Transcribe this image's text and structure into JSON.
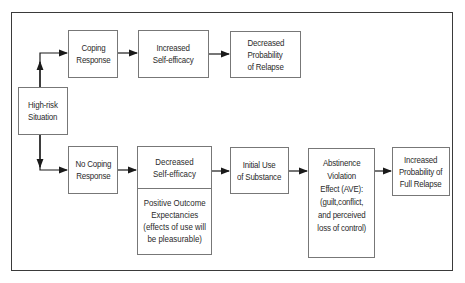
{
  "diagram": {
    "start": {
      "label": "High-risk\nSituation"
    },
    "upper_path": [
      {
        "id": "coping-response",
        "label": "Coping\nResponse"
      },
      {
        "id": "increased-self-efficacy",
        "label": "Increased\nSelf-efficacy"
      },
      {
        "id": "decreased-probability-relapse",
        "label": "Decreased\nProbability\nof Relapse"
      }
    ],
    "lower_path": [
      {
        "id": "no-coping-response",
        "label": "No Coping\nResponse"
      },
      {
        "id": "decreased-self-efficacy",
        "label": "Decreased\nSelf-efficacy",
        "sub_label": "Positive Outcome\nExpectancies\n(effects of use will\nbe pleasurable)"
      },
      {
        "id": "initial-use-substance",
        "label": "Initial Use\nof Substance"
      },
      {
        "id": "abstinence-violation-effect",
        "label": "Abstinence\nViolation\nEffect (AVE):\n(guilt,conflict,\nand perceived\nloss of control)"
      },
      {
        "id": "increased-probability-full-relapse",
        "label": "Increased\nProbability of\nFull Relapse"
      }
    ],
    "colors": {
      "line": "#1a1a1a",
      "box_border": "#777777",
      "frame": "#3a3a3a"
    }
  }
}
